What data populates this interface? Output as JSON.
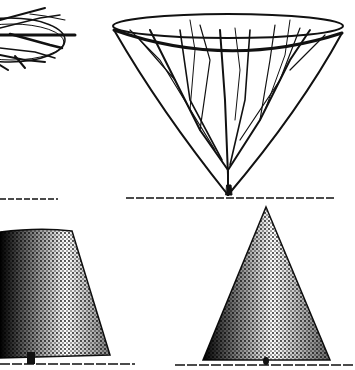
{
  "image": {
    "description": "Engraving of four trained tree forms: a flat open-crowned tree (cropped, top-left), a goblet/cone-shaped tree trained on hoops (top-right), a clipped truncated-cone topiary (bottom-left), and a clipped pointed-cone topiary (bottom-right).",
    "colors": {
      "ink": "#111111",
      "paper": "#ffffff"
    },
    "figures": [
      {
        "id": "flat-crown-tree",
        "position": "top-left"
      },
      {
        "id": "goblet-hoop-tree",
        "position": "top-right"
      },
      {
        "id": "truncated-cone-topiary",
        "position": "bottom-left"
      },
      {
        "id": "pointed-cone-topiary",
        "position": "bottom-right"
      }
    ]
  }
}
